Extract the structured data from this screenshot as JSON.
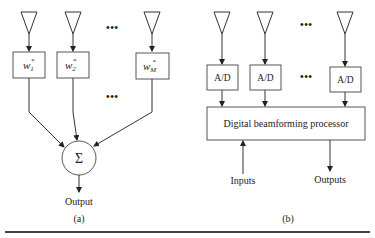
{
  "figure": {
    "panel_a": {
      "weights": [
        {
          "base": "w",
          "sub": "1",
          "sup": "*"
        },
        {
          "base": "w",
          "sub": "2",
          "sup": "*"
        },
        {
          "base": "w",
          "sub": "M",
          "sup": "*"
        }
      ],
      "summer_symbol": "Σ",
      "ellipsis": "•••",
      "output_label": "Output",
      "caption": "(a)"
    },
    "panel_b": {
      "converters": [
        "A/D",
        "A/D",
        "A/D"
      ],
      "ellipsis": "•••",
      "processor_label": "Digital beamforming processor",
      "inputs_label": "Inputs",
      "outputs_label": "Outputs",
      "caption": "(b)"
    }
  }
}
